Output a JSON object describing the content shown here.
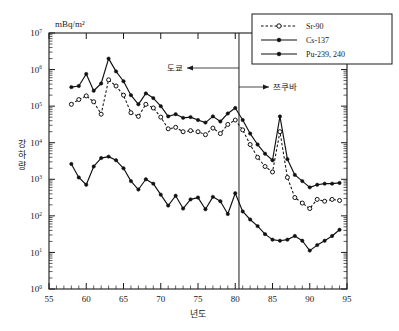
{
  "chart_data": {
    "type": "line",
    "title": "",
    "xlabel": "년도",
    "ylabel": "강하량",
    "unit_label": "mBq/m²",
    "xlim": [
      55,
      95
    ],
    "ylim": [
      0,
      7
    ],
    "y_log": true,
    "grid": false,
    "xticks": [
      55,
      60,
      65,
      70,
      75,
      80,
      85,
      90,
      95
    ],
    "ytick_labels": [
      "10⁷",
      "10⁶",
      "10⁵",
      "10⁴",
      "10³",
      "10²",
      "10¹",
      "10⁰"
    ],
    "ytick_exponents": [
      7,
      6,
      5,
      4,
      3,
      2,
      1,
      0
    ],
    "legend_position": "top-right",
    "annotations": [
      {
        "text": "도쿄",
        "year": 80.5,
        "direction": "left"
      },
      {
        "text": "쯔쿠바",
        "year": 80.5,
        "direction": "right"
      }
    ],
    "divider_year": 80.5,
    "series": [
      {
        "name": "Sr-90",
        "marker": "open-circle",
        "line": "dotted",
        "x": [
          58,
          59,
          60,
          61,
          62,
          63,
          64,
          65,
          66,
          67,
          68,
          69,
          70,
          71,
          72,
          73,
          74,
          75,
          76,
          77,
          78,
          79,
          80,
          81,
          82,
          83,
          84,
          85,
          86,
          87,
          88,
          89,
          90,
          91,
          92,
          93,
          94
        ],
        "values_log10": [
          5.05,
          5.18,
          5.28,
          5.12,
          4.78,
          5.72,
          5.55,
          5.3,
          4.82,
          4.72,
          5.05,
          4.95,
          4.7,
          4.38,
          4.42,
          4.3,
          4.33,
          4.3,
          4.22,
          4.4,
          4.25,
          4.5,
          4.62,
          4.35,
          3.95,
          3.6,
          3.35,
          3.2,
          4.3,
          3.05,
          2.5,
          2.35,
          2.2,
          2.45,
          2.4,
          2.45,
          2.42
        ]
      },
      {
        "name": "Cs-137",
        "marker": "filled-circle",
        "line": "solid",
        "x": [
          58,
          59,
          60,
          61,
          62,
          63,
          64,
          65,
          66,
          67,
          68,
          69,
          70,
          71,
          72,
          73,
          74,
          75,
          76,
          77,
          78,
          79,
          80,
          81,
          82,
          83,
          84,
          85,
          86,
          87,
          88,
          89,
          90,
          91,
          92,
          93,
          94
        ],
        "values_log10": [
          5.52,
          5.55,
          5.88,
          5.42,
          5.62,
          6.3,
          5.95,
          5.68,
          5.3,
          5.05,
          5.35,
          5.22,
          5.0,
          4.72,
          4.78,
          4.68,
          4.7,
          4.62,
          4.55,
          4.72,
          4.58,
          4.8,
          4.95,
          4.62,
          4.25,
          3.95,
          3.7,
          3.52,
          4.72,
          3.55,
          3.12,
          2.95,
          2.78,
          2.85,
          2.88,
          2.88,
          2.9
        ]
      },
      {
        "name": "Pu-239, 240",
        "marker": "filled-circle",
        "line": "solid",
        "x": [
          58,
          59,
          60,
          61,
          62,
          63,
          64,
          65,
          66,
          67,
          68,
          69,
          70,
          71,
          72,
          73,
          74,
          75,
          76,
          77,
          78,
          79,
          80,
          81,
          82,
          83,
          84,
          85,
          86,
          87,
          88,
          89,
          90,
          91,
          92,
          93,
          94
        ],
        "values_log10": [
          3.42,
          3.05,
          2.85,
          3.35,
          3.58,
          3.62,
          3.52,
          3.3,
          2.95,
          2.72,
          3.0,
          2.88,
          2.58,
          2.28,
          2.55,
          2.2,
          2.45,
          2.5,
          2.18,
          2.52,
          2.4,
          2.05,
          2.62,
          2.12,
          1.9,
          1.72,
          1.5,
          1.35,
          1.32,
          1.35,
          1.45,
          1.32,
          1.05,
          1.2,
          1.32,
          1.45,
          1.62
        ]
      }
    ]
  },
  "legend": {
    "items": [
      {
        "label": "Sr-90"
      },
      {
        "label": "Cs-137"
      },
      {
        "label": "Pu-239, 240"
      }
    ]
  }
}
